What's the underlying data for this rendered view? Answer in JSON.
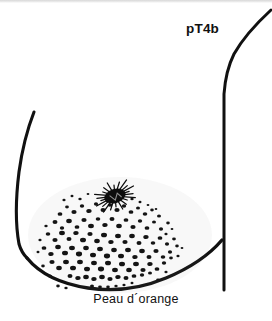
{
  "figure": {
    "domain": "diagram",
    "kind": "medical-line-illustration",
    "background_color": "#ffffff",
    "ink_color": "#111111",
    "width": 272,
    "height": 321
  },
  "labels": {
    "stage": "pT4b",
    "caption": "Peau d´orange"
  },
  "annotations": {
    "stage_label_name": "pT4b",
    "caption_label_name": "Peau d orange"
  },
  "anatomy": {
    "chest_wall_name": "chest-wall-line",
    "breast_upper_contour_name": "breast-upper-contour",
    "breast_lower_contour_name": "breast-lower-contour",
    "nipple_name": "retracted-nipple",
    "skin_texture_name": "peau-d-orange-dimpling"
  },
  "skin_texture": {
    "description": "orange-peel pitting over the inferior breast skin",
    "dot_color": "#141414",
    "dot_count": 126,
    "dots": [
      [
        60,
        214,
        2.4
      ],
      [
        67,
        207,
        1.9
      ],
      [
        74,
        212,
        2.6
      ],
      [
        82,
        206,
        2.2
      ],
      [
        89,
        211,
        2.7
      ],
      [
        96,
        204,
        2.1
      ],
      [
        103,
        210,
        2.5
      ],
      [
        110,
        205,
        2.3
      ],
      [
        117,
        210,
        2.6
      ],
      [
        124,
        206,
        2.2
      ],
      [
        131,
        212,
        2.4
      ],
      [
        138,
        208,
        2.0
      ],
      [
        145,
        214,
        2.3
      ],
      [
        152,
        210,
        1.8
      ],
      [
        159,
        216,
        2.0
      ],
      [
        55,
        222,
        2.5
      ],
      [
        62,
        228,
        2.2
      ],
      [
        69,
        221,
        2.8
      ],
      [
        77,
        227,
        2.4
      ],
      [
        84,
        220,
        2.6
      ],
      [
        91,
        226,
        2.9
      ],
      [
        98,
        219,
        2.3
      ],
      [
        105,
        225,
        2.7
      ],
      [
        112,
        219,
        2.5
      ],
      [
        119,
        226,
        2.8
      ],
      [
        126,
        220,
        2.4
      ],
      [
        133,
        227,
        2.6
      ],
      [
        140,
        221,
        2.2
      ],
      [
        147,
        228,
        2.4
      ],
      [
        154,
        222,
        2.0
      ],
      [
        161,
        229,
        2.1
      ],
      [
        168,
        223,
        1.8
      ],
      [
        48,
        234,
        2.3
      ],
      [
        55,
        240,
        2.6
      ],
      [
        62,
        233,
        2.9
      ],
      [
        69,
        239,
        2.5
      ],
      [
        76,
        233,
        2.7
      ],
      [
        83,
        240,
        3.0
      ],
      [
        90,
        234,
        2.6
      ],
      [
        97,
        241,
        2.8
      ],
      [
        104,
        235,
        3.0
      ],
      [
        111,
        242,
        2.7
      ],
      [
        118,
        236,
        2.9
      ],
      [
        125,
        242,
        2.6
      ],
      [
        132,
        236,
        2.8
      ],
      [
        139,
        243,
        2.5
      ],
      [
        146,
        237,
        2.7
      ],
      [
        153,
        243,
        2.3
      ],
      [
        160,
        238,
        2.4
      ],
      [
        167,
        244,
        2.1
      ],
      [
        174,
        239,
        1.9
      ],
      [
        44,
        248,
        2.4
      ],
      [
        51,
        254,
        2.7
      ],
      [
        58,
        247,
        2.8
      ],
      [
        65,
        253,
        3.0
      ],
      [
        72,
        248,
        2.9
      ],
      [
        79,
        254,
        3.1
      ],
      [
        86,
        248,
        2.8
      ],
      [
        93,
        255,
        3.0
      ],
      [
        100,
        249,
        2.9
      ],
      [
        107,
        256,
        3.1
      ],
      [
        114,
        250,
        2.8
      ],
      [
        121,
        256,
        3.0
      ],
      [
        128,
        250,
        2.9
      ],
      [
        135,
        257,
        2.7
      ],
      [
        142,
        251,
        2.8
      ],
      [
        149,
        257,
        2.5
      ],
      [
        156,
        251,
        2.6
      ],
      [
        163,
        257,
        2.3
      ],
      [
        170,
        252,
        2.1
      ],
      [
        177,
        246,
        1.8
      ],
      [
        52,
        262,
        2.6
      ],
      [
        59,
        268,
        2.8
      ],
      [
        66,
        262,
        2.9
      ],
      [
        73,
        268,
        3.0
      ],
      [
        80,
        262,
        2.9
      ],
      [
        87,
        269,
        3.0
      ],
      [
        94,
        263,
        2.9
      ],
      [
        101,
        269,
        3.1
      ],
      [
        108,
        263,
        3.0
      ],
      [
        115,
        270,
        2.9
      ],
      [
        122,
        264,
        3.0
      ],
      [
        129,
        270,
        2.8
      ],
      [
        136,
        264,
        2.9
      ],
      [
        143,
        270,
        2.6
      ],
      [
        150,
        264,
        2.7
      ],
      [
        157,
        269,
        2.4
      ],
      [
        164,
        263,
        2.2
      ],
      [
        171,
        258,
        1.9
      ],
      [
        70,
        276,
        2.5
      ],
      [
        78,
        278,
        2.7
      ],
      [
        86,
        277,
        2.8
      ],
      [
        94,
        279,
        2.7
      ],
      [
        102,
        277,
        2.8
      ],
      [
        110,
        279,
        2.6
      ],
      [
        118,
        277,
        2.7
      ],
      [
        126,
        278,
        2.5
      ],
      [
        134,
        276,
        2.4
      ],
      [
        142,
        275,
        2.2
      ],
      [
        150,
        273,
        2.0
      ],
      [
        64,
        200,
        1.6
      ],
      [
        72,
        196,
        1.5
      ],
      [
        80,
        199,
        1.7
      ],
      [
        88,
        194,
        1.4
      ],
      [
        132,
        199,
        1.7
      ],
      [
        140,
        202,
        1.5
      ],
      [
        148,
        205,
        1.4
      ],
      [
        156,
        209,
        1.3
      ],
      [
        46,
        226,
        1.7
      ],
      [
        40,
        240,
        1.6
      ],
      [
        38,
        252,
        1.5
      ],
      [
        166,
        234,
        1.6
      ],
      [
        172,
        229,
        1.4
      ],
      [
        58,
        286,
        1.8
      ],
      [
        66,
        288,
        1.7
      ],
      [
        158,
        280,
        1.8
      ],
      [
        166,
        272,
        1.6
      ],
      [
        92,
        286,
        2.0
      ],
      [
        100,
        287,
        1.9
      ],
      [
        108,
        287,
        1.8
      ],
      [
        116,
        286,
        1.7
      ],
      [
        124,
        285,
        1.6
      ],
      [
        132,
        283,
        1.5
      ],
      [
        50,
        276,
        2.0
      ],
      [
        43,
        266,
        1.8
      ],
      [
        178,
        256,
        1.6
      ],
      [
        182,
        248,
        1.4
      ]
    ]
  },
  "nipple_detail": {
    "center": [
      115,
      196
    ],
    "radius_x": 11,
    "radius_y": 7,
    "rotation_deg": -18,
    "spike_count": 22,
    "fill_color": "#0d0d0d"
  }
}
